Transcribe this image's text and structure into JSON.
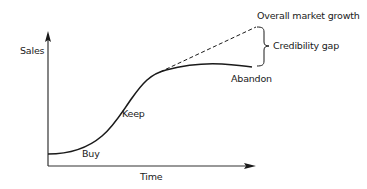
{
  "diagram": {
    "type": "market-growth-vs-product-adoption",
    "axes": {
      "y_label": "Sales",
      "x_label": "Time"
    },
    "curve_labels": {
      "buy": "Buy",
      "keep": "Keep",
      "abandon": "Abandon"
    },
    "trend_line_label": "Overall market growth",
    "gap_label": "Credibility gap",
    "colors": {
      "line": "#1a1a1a",
      "axis": "#333333",
      "background": "#ffffff"
    }
  }
}
